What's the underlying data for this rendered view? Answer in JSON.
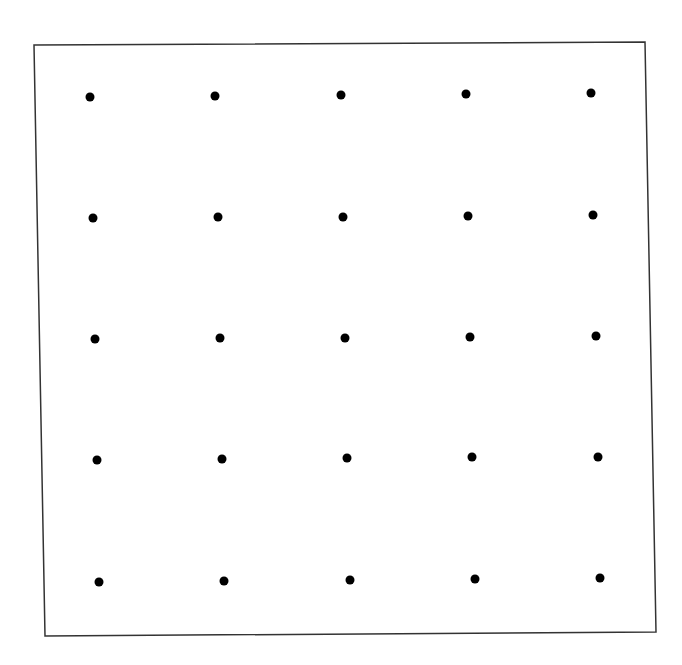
{
  "diagram": {
    "type": "dot-grid",
    "rows": 5,
    "cols": 5,
    "frame": {
      "corners": [
        [
          34,
          45
        ],
        [
          645,
          42
        ],
        [
          656,
          632
        ],
        [
          45,
          636
        ]
      ],
      "stroke": "#333333",
      "stroke_width": 1.5
    },
    "dot": {
      "radius": 4.5,
      "color": "#000000"
    },
    "dots": [
      [
        [
          90,
          97
        ],
        [
          215,
          96
        ],
        [
          341,
          95
        ],
        [
          466,
          94
        ],
        [
          591,
          93
        ]
      ],
      [
        [
          93,
          218
        ],
        [
          218,
          217
        ],
        [
          343,
          217
        ],
        [
          468,
          216
        ],
        [
          593,
          215
        ]
      ],
      [
        [
          95,
          339
        ],
        [
          220,
          338
        ],
        [
          345,
          338
        ],
        [
          470,
          337
        ],
        [
          596,
          336
        ]
      ],
      [
        [
          97,
          460
        ],
        [
          222,
          459
        ],
        [
          347,
          458
        ],
        [
          472,
          457
        ],
        [
          598,
          457
        ]
      ],
      [
        [
          99,
          582
        ],
        [
          224,
          581
        ],
        [
          350,
          580
        ],
        [
          475,
          579
        ],
        [
          600,
          578
        ]
      ]
    ]
  }
}
